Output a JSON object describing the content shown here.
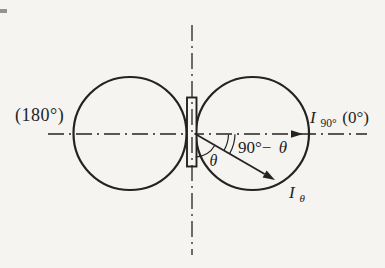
{
  "diagram": {
    "name": "dipole-figure-eight-radiation-pattern",
    "colors": {
      "ink": "#232323",
      "paper": "#f5f4f1"
    },
    "labels": {
      "left_angle": "(180°)",
      "i90": {
        "base": "I",
        "sub": "90°",
        "suffix": "(0°)"
      },
      "complement": {
        "prefix": "90°−",
        "theta": "θ"
      },
      "theta": "θ",
      "i_theta": {
        "base": "I",
        "sub": "θ"
      }
    }
  }
}
